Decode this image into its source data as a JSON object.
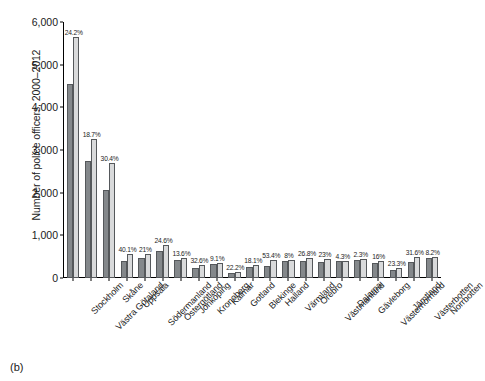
{
  "figure": {
    "caption": "(b)",
    "ylabel": "Number of police officers, 2000–2012"
  },
  "colors": {
    "bar_2000": "#84888b",
    "bar_2012": "#d9dadb",
    "bar_edge": "#55585b",
    "axis": "#000000",
    "background": "#ffffff"
  },
  "chart_data": {
    "type": "bar",
    "title": "",
    "xlabel": "",
    "ylabel": "Number of police officers, 2000–2012",
    "ylim": [
      0,
      6000
    ],
    "yticks": [
      0,
      1000,
      2000,
      3000,
      4000,
      5000,
      6000
    ],
    "ytick_labels": [
      "0",
      "1,000",
      "2,000",
      "3,000",
      "4,000",
      "5,000",
      "6,000"
    ],
    "grid": false,
    "legend": "none",
    "categories": [
      "Stockholm",
      "Västra Götaland",
      "Skåne",
      "Uppsala",
      "Södermanland",
      "Östergötland",
      "Jönköping",
      "Kronoberg",
      "Kalmar",
      "Gotland",
      "Blekinge",
      "Halland",
      "Värmland",
      "Örebro",
      "Västmanland",
      "Dalarna",
      "Gävleborg",
      "Västernorrland",
      "Jämtland",
      "Västerbotten",
      "Norrbotten"
    ],
    "series": [
      {
        "name": "2000",
        "values": [
          4540,
          2740,
          2060,
          400,
          460,
          630,
          420,
          230,
          330,
          120,
          250,
          280,
          400,
          390,
          370,
          390,
          430,
          350,
          190,
          370,
          460
        ]
      },
      {
        "name": "2012",
        "values": [
          5640,
          3250,
          2685,
          560,
          557,
          785,
          477,
          305,
          360,
          147,
          295,
          429,
          432,
          480,
          455,
          407,
          440,
          406,
          234,
          487,
          498
        ]
      }
    ],
    "data_labels": [
      "24.2%",
      "18.7%",
      "30.4%",
      "40.1%",
      "21%",
      "24.6%",
      "13.6%",
      "32.6%",
      "9.1%",
      "22.2%",
      "18.1%",
      "53.4%",
      "8%",
      "26.8%",
      "23%",
      "4.3%",
      "2.3%",
      "16%",
      "23.3%",
      "31.6%",
      "8.2%"
    ],
    "data_label_note": "percentage increase 2000 to 2012"
  }
}
